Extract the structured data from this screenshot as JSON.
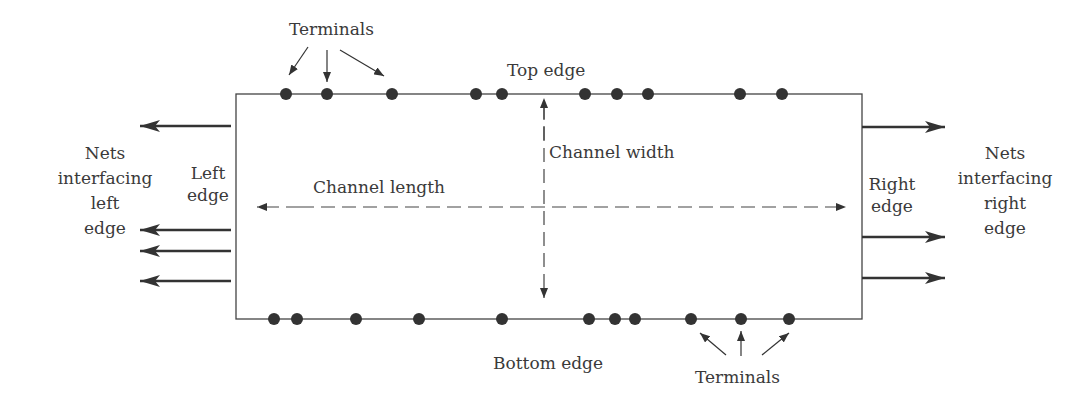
{
  "diagram": {
    "title": "",
    "box": {
      "left": 236,
      "top": 94,
      "right": 862,
      "bottom": 319
    },
    "colors": {
      "line": "#444444",
      "dot": "#333333",
      "text": "#3a3a3a",
      "background": "#ffffff"
    },
    "labels": {
      "terminals_top": "Terminals",
      "top_edge": "Top edge",
      "channel_width": "Channel width",
      "channel_length": "Channel length",
      "left_edge": "Left\nedge",
      "right_edge": "Right\nedge",
      "nets_left": "Nets\ninterfacing\nleft\nedge",
      "nets_right": "Nets\ninterfacing\nright\nedge",
      "bottom_edge": "Bottom edge",
      "terminals_bottom": "Terminals"
    },
    "top_terminals_x": [
      286,
      327,
      392,
      476,
      502,
      585,
      617,
      648,
      740,
      782
    ],
    "bottom_terminals_x": [
      274,
      297,
      356,
      419,
      502,
      589,
      615,
      635,
      691,
      741,
      789
    ],
    "left_net_arrows_y": [
      126,
      230,
      251,
      281
    ],
    "right_net_arrows_y": [
      127,
      237,
      278
    ]
  }
}
